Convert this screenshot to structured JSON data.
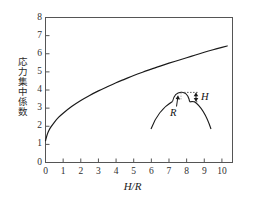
{
  "figure": {
    "background_color": "#ffffff",
    "line_color": "#1a1a1a",
    "axis_color": "#555555"
  },
  "axes": {
    "x_title": "H/R",
    "y_title": "応力集中係数",
    "x_ticks": [
      "0",
      "1",
      "2",
      "3",
      "4",
      "5",
      "6",
      "7",
      "8",
      "9",
      "10"
    ],
    "y_ticks": [
      "0",
      "1",
      "2",
      "3",
      "4",
      "5",
      "6",
      "7",
      "8"
    ]
  },
  "inset": {
    "name": "notch-geometry-diagram",
    "label_height": "H",
    "label_radius": "R"
  },
  "chart_data": {
    "type": "line",
    "title": "",
    "subtitle": "",
    "xlabel": "H/R",
    "ylabel": "応力集中係数",
    "xlim": [
      0,
      10.6
    ],
    "ylim": [
      0,
      8
    ],
    "xticks": [
      0,
      1,
      2,
      3,
      4,
      5,
      6,
      7,
      8,
      9,
      10
    ],
    "yticks": [
      0,
      1,
      2,
      3,
      4,
      5,
      6,
      7,
      8
    ],
    "grid": false,
    "legend": null,
    "annotations": [
      {
        "text": "H",
        "role": "inset-notch-height"
      },
      {
        "text": "R",
        "role": "inset-notch-radius"
      }
    ],
    "series": [
      {
        "name": "stress concentration factor",
        "x": [
          0.0,
          0.1,
          0.2,
          0.3,
          0.5,
          0.75,
          1.0,
          1.5,
          2.0,
          2.5,
          3.0,
          3.5,
          4.0,
          4.5,
          5.0,
          5.5,
          6.0,
          6.5,
          7.0,
          7.5,
          8.0,
          8.5,
          9.0,
          9.5,
          10.0,
          10.3
        ],
        "y": [
          1.2,
          1.55,
          1.78,
          1.95,
          2.22,
          2.5,
          2.72,
          3.1,
          3.42,
          3.7,
          3.95,
          4.18,
          4.4,
          4.6,
          4.8,
          4.98,
          5.15,
          5.32,
          5.48,
          5.63,
          5.78,
          5.93,
          6.08,
          6.22,
          6.35,
          6.43
        ]
      }
    ]
  }
}
